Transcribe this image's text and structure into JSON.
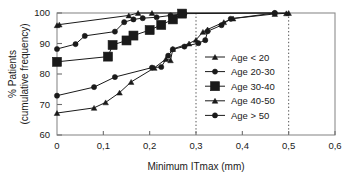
{
  "chart_data": {
    "type": "line",
    "title": "",
    "subtitle": "",
    "xlabel": "Minimum ITmax (mm)",
    "ylabel": "% Patients\n(cumulative frequency)",
    "ylabel_line1": "% Patients",
    "ylabel_line2": "(cumulative frequency)",
    "xlim": [
      0,
      0.6
    ],
    "ylim": [
      60,
      100
    ],
    "xticks": [
      0,
      0.1,
      0.2,
      0.3,
      0.4,
      0.5,
      0.6
    ],
    "xtick_labels": [
      "0",
      "0,1",
      "0,2",
      "0,3",
      "0,4",
      "0,5",
      "0,6"
    ],
    "yticks": [
      60,
      70,
      80,
      90,
      100
    ],
    "ytick_labels": [
      "60",
      "70",
      "80",
      "90",
      "100"
    ],
    "grid": false,
    "reference_lines": [
      {
        "axis": "x",
        "value": 0.3,
        "style": "dotted",
        "color": "#555555"
      },
      {
        "axis": "x",
        "value": 0.5,
        "style": "dotted",
        "color": "#555555"
      }
    ],
    "legend_position": "center-right",
    "line_color": "#1a1a1a",
    "series": [
      {
        "name": "Age < 20",
        "marker": "triangle",
        "marker_size": "small",
        "color": "#1a1a1a",
        "points": [
          {
            "x": 0.0,
            "y": 96.0
          },
          {
            "x": 0.005,
            "y": 96.2
          },
          {
            "x": 0.155,
            "y": 99.2
          },
          {
            "x": 0.175,
            "y": 100.0
          },
          {
            "x": 0.205,
            "y": 100.0
          },
          {
            "x": 0.5,
            "y": 100.0
          }
        ]
      },
      {
        "name": "Age 20-30",
        "marker": "circle",
        "marker_size": "small",
        "color": "#1a1a1a",
        "points": [
          {
            "x": 0.0,
            "y": 88.2
          },
          {
            "x": 0.04,
            "y": 89.8
          },
          {
            "x": 0.06,
            "y": 92.5
          },
          {
            "x": 0.125,
            "y": 93.9
          },
          {
            "x": 0.145,
            "y": 97.0
          },
          {
            "x": 0.165,
            "y": 97.9
          },
          {
            "x": 0.185,
            "y": 98.3
          },
          {
            "x": 0.215,
            "y": 98.6
          },
          {
            "x": 0.245,
            "y": 99.2
          },
          {
            "x": 0.275,
            "y": 99.8
          },
          {
            "x": 0.47,
            "y": 100.0
          }
        ]
      },
      {
        "name": "Age 30-40",
        "marker": "square",
        "marker_size": "large",
        "color": "#1a1a1a",
        "points": [
          {
            "x": 0.0,
            "y": 84.0
          },
          {
            "x": 0.11,
            "y": 85.7
          },
          {
            "x": 0.12,
            "y": 89.5
          },
          {
            "x": 0.15,
            "y": 91.0
          },
          {
            "x": 0.165,
            "y": 92.6
          },
          {
            "x": 0.2,
            "y": 94.4
          },
          {
            "x": 0.225,
            "y": 96.1
          },
          {
            "x": 0.25,
            "y": 97.9
          },
          {
            "x": 0.27,
            "y": 99.8
          }
        ]
      },
      {
        "name": "Age 40-50",
        "marker": "triangle",
        "marker_size": "small",
        "color": "#1a1a1a",
        "points": [
          {
            "x": 0.0,
            "y": 67.2
          },
          {
            "x": 0.08,
            "y": 68.9
          },
          {
            "x": 0.105,
            "y": 70.7
          },
          {
            "x": 0.135,
            "y": 73.9
          },
          {
            "x": 0.16,
            "y": 77.4
          },
          {
            "x": 0.21,
            "y": 82.0
          },
          {
            "x": 0.235,
            "y": 84.9
          },
          {
            "x": 0.245,
            "y": 84.5
          },
          {
            "x": 0.25,
            "y": 88.2
          },
          {
            "x": 0.285,
            "y": 90.0
          },
          {
            "x": 0.3,
            "y": 91.2
          },
          {
            "x": 0.315,
            "y": 93.8
          },
          {
            "x": 0.325,
            "y": 94.6
          },
          {
            "x": 0.36,
            "y": 97.0
          },
          {
            "x": 0.38,
            "y": 98.2
          },
          {
            "x": 0.47,
            "y": 99.7
          },
          {
            "x": 0.495,
            "y": 99.9
          }
        ]
      },
      {
        "name": "Age > 50",
        "marker": "circle",
        "marker_size": "small",
        "color": "#1a1a1a",
        "points": [
          {
            "x": 0.0,
            "y": 72.9
          },
          {
            "x": 0.08,
            "y": 75.7
          },
          {
            "x": 0.125,
            "y": 79.0
          },
          {
            "x": 0.205,
            "y": 82.1
          },
          {
            "x": 0.225,
            "y": 82.3
          },
          {
            "x": 0.24,
            "y": 86.0
          },
          {
            "x": 0.25,
            "y": 88.1
          },
          {
            "x": 0.275,
            "y": 89.0
          },
          {
            "x": 0.305,
            "y": 90.1
          },
          {
            "x": 0.32,
            "y": 91.1
          },
          {
            "x": 0.325,
            "y": 94.0
          },
          {
            "x": 0.355,
            "y": 96.0
          },
          {
            "x": 0.375,
            "y": 98.1
          },
          {
            "x": 0.47,
            "y": 100.0
          }
        ]
      }
    ]
  }
}
